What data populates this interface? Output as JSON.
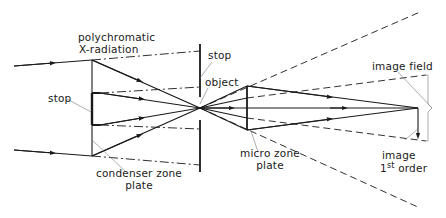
{
  "diagram": {
    "colors": {
      "line": "#1a1a1a",
      "leader": "#777777",
      "background": "#ffffff"
    },
    "labels": {
      "source_line1": "polychromatic",
      "source_line2": "X-radiation",
      "stop_left": "stop",
      "condenser_line1": "condenser zone",
      "condenser_line2": "plate",
      "stop_center": "stop",
      "object": "object",
      "micro_line1": "micro zone",
      "micro_line2": "plate",
      "image_field": "image field",
      "image_line1": "image",
      "image_order_num": "1",
      "image_order_sup": "st",
      "image_order_word": "order"
    },
    "components": [
      {
        "name": "polychromatic X-radiation",
        "type": "source"
      },
      {
        "name": "condenser zone plate",
        "type": "optic"
      },
      {
        "name": "stop",
        "type": "aperture"
      },
      {
        "name": "object",
        "type": "specimen"
      },
      {
        "name": "micro zone plate",
        "type": "optic"
      },
      {
        "name": "image 1st order",
        "type": "image"
      },
      {
        "name": "image field",
        "type": "region"
      }
    ]
  }
}
